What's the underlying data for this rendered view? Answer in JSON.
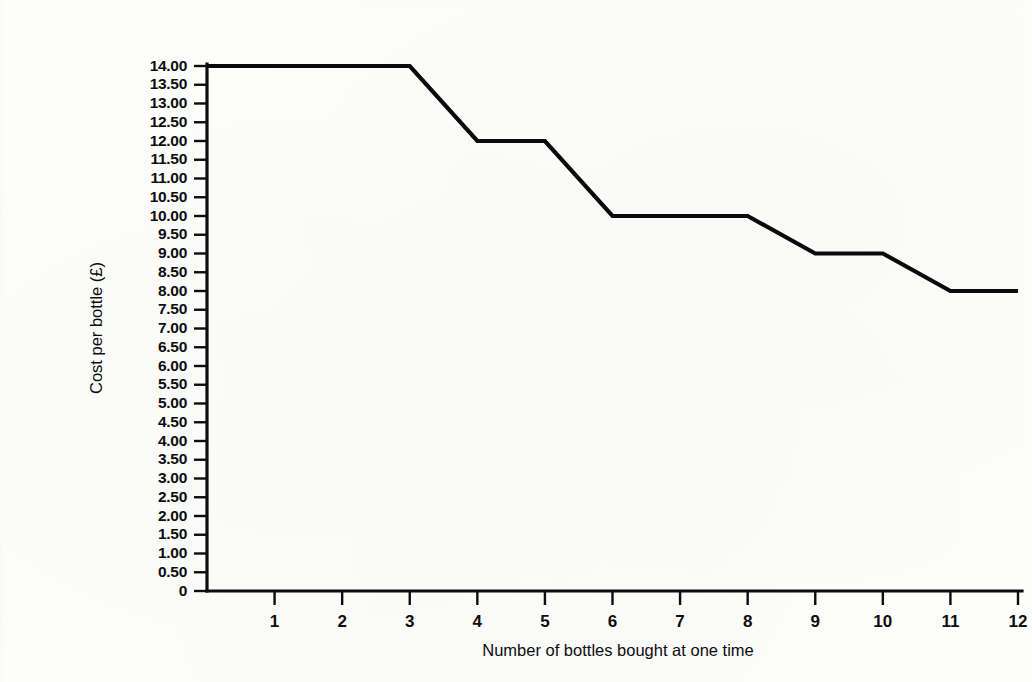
{
  "chart_data": {
    "type": "line",
    "title": "",
    "subtitle": "",
    "xlabel": "Number of bottles bought at one time",
    "ylabel": "Cost per bottle (£)",
    "xlim": [
      0,
      12
    ],
    "ylim": [
      0,
      14
    ],
    "grid": false,
    "legend": null,
    "x_tick_labels": [
      "1",
      "2",
      "3",
      "4",
      "5",
      "6",
      "7",
      "8",
      "9",
      "10",
      "11",
      "12"
    ],
    "x_tick_values": [
      1,
      2,
      3,
      4,
      5,
      6,
      7,
      8,
      9,
      10,
      11,
      12
    ],
    "y_tick_labels": [
      "14.00",
      "13.50",
      "13.00",
      "12.50",
      "12.00",
      "11.50",
      "11.00",
      "10.50",
      "10.00",
      "9.50",
      "9.00",
      "8.50",
      "8.00",
      "7.50",
      "7.00",
      "6.50",
      "6.00",
      "5.50",
      "5.00",
      "4.50",
      "4.00",
      "3.50",
      "3.00",
      "2.50",
      "2.00",
      "1.50",
      "1.00",
      "0.50",
      "0"
    ],
    "y_tick_values": [
      14,
      13.5,
      13,
      12.5,
      12,
      11.5,
      11,
      10.5,
      10,
      9.5,
      9,
      8.5,
      8,
      7.5,
      7,
      6.5,
      6,
      5.5,
      5,
      4.5,
      4,
      3.5,
      3,
      2.5,
      2,
      1.5,
      1,
      0.5,
      0
    ],
    "series": [
      {
        "name": "Cost per bottle",
        "color": "#0a0a0a",
        "points": [
          {
            "x": 0,
            "y": 14.0
          },
          {
            "x": 3,
            "y": 14.0
          },
          {
            "x": 4,
            "y": 12.0
          },
          {
            "x": 5,
            "y": 12.0
          },
          {
            "x": 6,
            "y": 10.0
          },
          {
            "x": 8,
            "y": 10.0
          },
          {
            "x": 9,
            "y": 9.0
          },
          {
            "x": 10,
            "y": 9.0
          },
          {
            "x": 11,
            "y": 8.0
          },
          {
            "x": 12,
            "y": 8.0
          }
        ]
      }
    ],
    "step_summary": [
      {
        "bottles": "1-3",
        "cost_per_bottle": 14.0
      },
      {
        "bottles": "4-5",
        "cost_per_bottle": 12.0
      },
      {
        "bottles": "6-8",
        "cost_per_bottle": 10.0
      },
      {
        "bottles": "9-10",
        "cost_per_bottle": 9.0
      },
      {
        "bottles": "11-12",
        "cost_per_bottle": 8.0
      }
    ],
    "colors": {
      "line": "#0a0a0a",
      "axis": "#0d0d0d",
      "background": "#fdfdfc",
      "text": "#0d0d0d"
    }
  }
}
